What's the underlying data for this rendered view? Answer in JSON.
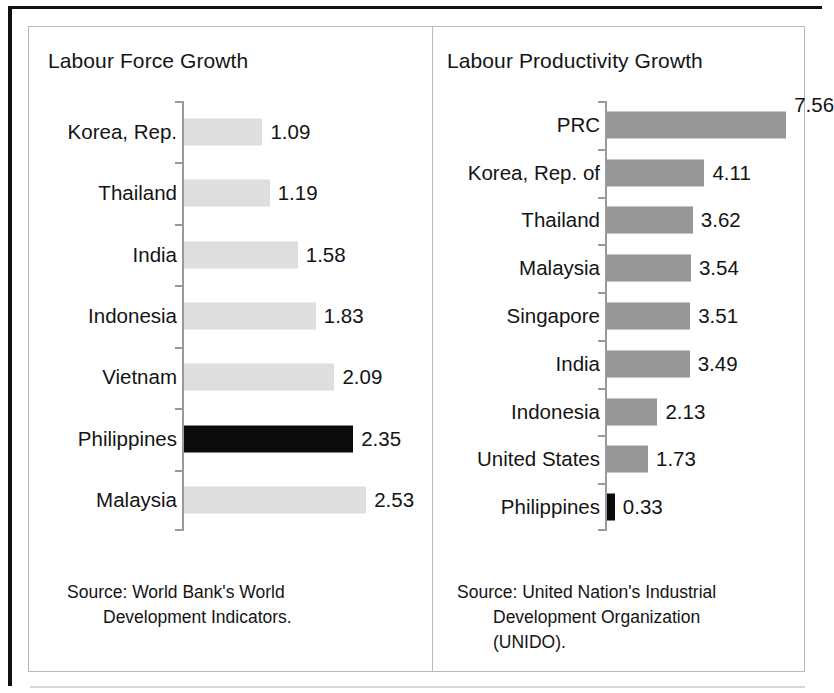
{
  "figure": {
    "panels": [
      {
        "id": "labour-force-growth",
        "title": "Labour Force Growth",
        "source": "Source: World Bank's World",
        "source_indent": "Development Indicators.",
        "bar_color": "#dedede",
        "highlight_color": "#0b0b0b",
        "px_per_unit": 72,
        "rows": [
          {
            "label": "Korea, Rep.",
            "value": "1.09",
            "n": 1.09,
            "highlight": false
          },
          {
            "label": "Thailand",
            "value": "1.19",
            "n": 1.19,
            "highlight": false
          },
          {
            "label": "India",
            "value": "1.58",
            "n": 1.58,
            "highlight": false
          },
          {
            "label": "Indonesia",
            "value": "1.83",
            "n": 1.83,
            "highlight": false
          },
          {
            "label": "Vietnam",
            "value": "2.09",
            "n": 2.09,
            "highlight": false
          },
          {
            "label": "Philippines",
            "value": "2.35",
            "n": 2.35,
            "highlight": true
          },
          {
            "label": "Malaysia",
            "value": "2.53",
            "n": 2.53,
            "highlight": false
          }
        ]
      },
      {
        "id": "labour-productivity-growth",
        "title": "Labour Productivity Growth",
        "source": "Source: United Nation's Industrial",
        "source_indent": "Development Organization\n(UNIDO).",
        "bar_color": "#969696",
        "highlight_color": "#0b0b0b",
        "px_per_unit": 23.7,
        "rows": [
          {
            "label": "PRC",
            "value": "7.56",
            "n": 7.56,
            "highlight": false,
            "value_above": true
          },
          {
            "label": "Korea, Rep. of",
            "value": "4.11",
            "n": 4.11,
            "highlight": false
          },
          {
            "label": "Thailand",
            "value": "3.62",
            "n": 3.62,
            "highlight": false
          },
          {
            "label": "Malaysia",
            "value": "3.54",
            "n": 3.54,
            "highlight": false
          },
          {
            "label": "Singapore",
            "value": "3.51",
            "n": 3.51,
            "highlight": false
          },
          {
            "label": "India",
            "value": "3.49",
            "n": 3.49,
            "highlight": false
          },
          {
            "label": "Indonesia",
            "value": "2.13",
            "n": 2.13,
            "highlight": false
          },
          {
            "label": "United States",
            "value": "1.73",
            "n": 1.73,
            "highlight": false
          },
          {
            "label": "Philippines",
            "value": "0.33",
            "n": 0.33,
            "highlight": true
          }
        ]
      }
    ]
  },
  "chart_data": [
    {
      "type": "bar",
      "orientation": "horizontal",
      "title": "Labour Force Growth",
      "xlabel": "",
      "ylabel": "",
      "categories": [
        "Korea, Rep.",
        "Thailand",
        "India",
        "Indonesia",
        "Vietnam",
        "Philippines",
        "Malaysia"
      ],
      "values": [
        1.09,
        1.19,
        1.58,
        1.83,
        2.09,
        2.35,
        2.53
      ],
      "data_labels": [
        "1.09",
        "1.19",
        "1.58",
        "1.83",
        "2.09",
        "2.35",
        "2.53"
      ],
      "highlighted_category": "Philippines",
      "bar_color": "#dedede",
      "highlight_color": "#0b0b0b",
      "xlim": [
        0,
        2.53
      ],
      "grid": false,
      "legend": null,
      "annotations": [
        "Source: World Bank's World Development Indicators."
      ]
    },
    {
      "type": "bar",
      "orientation": "horizontal",
      "title": "Labour Productivity Growth",
      "xlabel": "",
      "ylabel": "",
      "categories": [
        "PRC",
        "Korea, Rep. of",
        "Thailand",
        "Malaysia",
        "Singapore",
        "India",
        "Indonesia",
        "United States",
        "Philippines"
      ],
      "values": [
        7.56,
        4.11,
        3.62,
        3.54,
        3.51,
        3.49,
        2.13,
        1.73,
        0.33
      ],
      "data_labels": [
        "7.56",
        "4.11",
        "3.62",
        "3.54",
        "3.51",
        "3.49",
        "2.13",
        "1.73",
        "0.33"
      ],
      "highlighted_category": "Philippines",
      "bar_color": "#969696",
      "highlight_color": "#0b0b0b",
      "xlim": [
        0,
        7.56
      ],
      "grid": false,
      "legend": null,
      "annotations": [
        "Source: United Nation's Industrial Development Organization (UNIDO)."
      ]
    }
  ]
}
